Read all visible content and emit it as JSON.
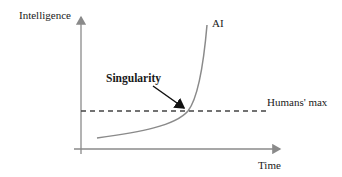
{
  "diagram": {
    "y_axis_label": "Intelligence",
    "x_axis_label": "Time",
    "curve_label": "AI",
    "threshold_label": "Humans' max",
    "annotation_label": "Singularity"
  },
  "colors": {
    "axis": "#8a8a8a",
    "curve": "#8a8a8a",
    "dashed": "#444444",
    "arrow": "#111111",
    "text": "#1a1a1a"
  }
}
